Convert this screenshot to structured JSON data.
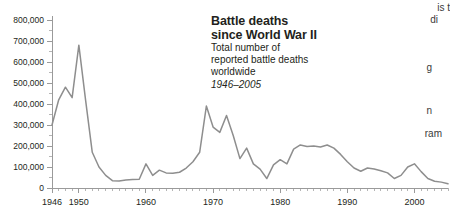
{
  "titleblock": {
    "heading_line1": "Battle deaths",
    "heading_line2": "since World War II",
    "sub_line1": "Total number of",
    "sub_line2": "reported battle deaths",
    "sub_line3": "worldwide",
    "years": "1946–2005"
  },
  "gutter": {
    "fragments": [
      {
        "text": "is  t",
        "top": 2,
        "right": 0
      },
      {
        "text": "di",
        "top": 14,
        "right": 12
      },
      {
        "text": "g",
        "top": 62,
        "right": 18
      },
      {
        "text": "n",
        "top": 105,
        "right": 18
      },
      {
        "text": "ram",
        "top": 128,
        "right": 8
      }
    ]
  },
  "colors": {
    "line": "#8e8e8e",
    "axis": "#9a9a9a",
    "tick_minor": "#b5b5b5",
    "text": "#231f20",
    "background": "#ffffff"
  },
  "chart_data": {
    "type": "line",
    "title": "Battle deaths since World War II",
    "subtitle": "Total number of reported battle deaths worldwide",
    "xlabel": "",
    "ylabel": "",
    "xlim": [
      1946,
      2005
    ],
    "ylim": [
      0,
      800000
    ],
    "grid": false,
    "legend": null,
    "y_ticks_major": [
      0,
      100000,
      200000,
      300000,
      400000,
      500000,
      600000,
      700000,
      800000
    ],
    "y_tick_labels": [
      "0",
      "100,000",
      "200,000",
      "300,000",
      "400,000",
      "500,000",
      "600,000",
      "700,000",
      "800,000"
    ],
    "y_ticks_minor": [
      50000,
      150000,
      250000,
      350000,
      450000,
      550000,
      650000,
      750000
    ],
    "x_ticks_major": [
      1946,
      1950,
      1960,
      1970,
      1980,
      1990,
      2000
    ],
    "x_tick_labels": [
      "1946",
      "1950",
      "1960",
      "1970",
      "1980",
      "1990",
      "2000"
    ],
    "x_ticks_minor": [
      1947,
      1948,
      1949,
      1951,
      1952,
      1953,
      1954,
      1955,
      1956,
      1957,
      1958,
      1959,
      1961,
      1962,
      1963,
      1964,
      1965,
      1966,
      1967,
      1968,
      1969,
      1971,
      1972,
      1973,
      1974,
      1975,
      1976,
      1977,
      1978,
      1979,
      1981,
      1982,
      1983,
      1984,
      1985,
      1986,
      1987,
      1988,
      1989,
      1991,
      1992,
      1993,
      1994,
      1995,
      1996,
      1997,
      1998,
      1999,
      2001,
      2002,
      2003,
      2004,
      2005
    ],
    "x": [
      1946,
      1947,
      1948,
      1949,
      1950,
      1951,
      1952,
      1953,
      1954,
      1955,
      1956,
      1957,
      1958,
      1959,
      1960,
      1961,
      1962,
      1963,
      1964,
      1965,
      1966,
      1967,
      1968,
      1969,
      1970,
      1971,
      1972,
      1973,
      1974,
      1975,
      1976,
      1977,
      1978,
      1979,
      1980,
      1981,
      1982,
      1983,
      1984,
      1985,
      1986,
      1987,
      1988,
      1989,
      1990,
      1991,
      1992,
      1993,
      1994,
      1995,
      1996,
      1997,
      1998,
      1999,
      2000,
      2001,
      2002,
      2003,
      2004,
      2005
    ],
    "values": [
      300000,
      420000,
      480000,
      430000,
      680000,
      420000,
      170000,
      100000,
      60000,
      35000,
      33000,
      38000,
      40000,
      42000,
      115000,
      60000,
      85000,
      72000,
      70000,
      75000,
      95000,
      125000,
      170000,
      390000,
      290000,
      265000,
      345000,
      250000,
      140000,
      190000,
      115000,
      90000,
      45000,
      110000,
      135000,
      115000,
      185000,
      205000,
      198000,
      200000,
      195000,
      205000,
      190000,
      160000,
      125000,
      95000,
      80000,
      95000,
      90000,
      82000,
      72000,
      45000,
      60000,
      100000,
      115000,
      78000,
      45000,
      32000,
      28000,
      20000
    ],
    "series": [
      {
        "name": "Reported battle deaths worldwide",
        "values": [
          300000,
          420000,
          480000,
          430000,
          680000,
          420000,
          170000,
          100000,
          60000,
          35000,
          33000,
          38000,
          40000,
          42000,
          115000,
          60000,
          85000,
          72000,
          70000,
          75000,
          95000,
          125000,
          170000,
          390000,
          290000,
          265000,
          345000,
          250000,
          140000,
          190000,
          115000,
          90000,
          45000,
          110000,
          135000,
          115000,
          185000,
          205000,
          198000,
          200000,
          195000,
          205000,
          190000,
          160000,
          125000,
          95000,
          80000,
          95000,
          90000,
          82000,
          72000,
          45000,
          60000,
          100000,
          115000,
          78000,
          45000,
          32000,
          28000,
          20000
        ]
      }
    ]
  }
}
